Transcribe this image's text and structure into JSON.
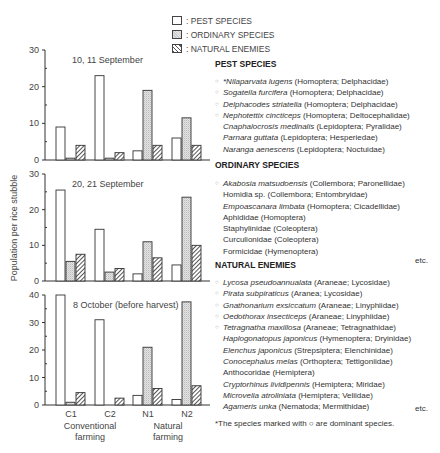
{
  "legend": {
    "items": [
      {
        "key": "pest",
        "label": ": PEST SPECIES"
      },
      {
        "key": "ordinary",
        "label": ": ORDINARY SPECIES"
      },
      {
        "key": "natural",
        "label": ": NATURAL ENEMIES"
      }
    ]
  },
  "chart_data": {
    "type": "bar",
    "ylabel": "Population per rice stubble",
    "categories": [
      "C1",
      "C2",
      "N1",
      "N2"
    ],
    "group_labels": [
      {
        "label_line1": "Conventional",
        "label_line2": "farming",
        "covers": [
          "C1",
          "C2"
        ]
      },
      {
        "label_line1": "Natural",
        "label_line2": "farming",
        "covers": [
          "N1",
          "N2"
        ]
      }
    ],
    "series_names": [
      "Pest species",
      "Ordinary species",
      "Natural enemies"
    ],
    "panels": [
      {
        "title": "10, 11 September",
        "ylim": [
          0,
          30
        ],
        "yticks": [
          0,
          10,
          20,
          30
        ],
        "series": [
          {
            "name": "Pest species",
            "values": [
              9,
              23,
              2.5,
              6
            ]
          },
          {
            "name": "Ordinary species",
            "values": [
              0.5,
              0.5,
              19,
              11.5
            ]
          },
          {
            "name": "Natural enemies",
            "values": [
              4,
              2,
              4,
              4
            ]
          }
        ]
      },
      {
        "title": "20, 21 September",
        "ylim": [
          0,
          30
        ],
        "yticks": [
          0,
          10,
          20,
          30
        ],
        "series": [
          {
            "name": "Pest species",
            "values": [
              25.5,
              14.5,
              2,
              4.5
            ]
          },
          {
            "name": "Ordinary species",
            "values": [
              5.5,
              2.5,
              11,
              23.5
            ]
          },
          {
            "name": "Natural enemies",
            "values": [
              7.5,
              3.5,
              6.5,
              10
            ]
          }
        ]
      },
      {
        "title": "8 October (before harvest)",
        "ylim": [
          0,
          40
        ],
        "yticks": [
          0,
          10,
          20,
          30,
          40
        ],
        "series": [
          {
            "name": "Pest species",
            "values": [
              40,
              31,
              3.5,
              2
            ]
          },
          {
            "name": "Ordinary species",
            "values": [
              1,
              0,
              21,
              37.5
            ]
          },
          {
            "name": "Natural enemies",
            "values": [
              4.5,
              2.5,
              6,
              7
            ]
          }
        ]
      }
    ]
  },
  "species": {
    "pest": {
      "title": "PEST SPECIES",
      "items": [
        {
          "dominant": true,
          "name": "*Nilaparvata lugens",
          "italic": true,
          "taxon": " (Homoptera; Delphacidae)"
        },
        {
          "dominant": true,
          "name": "Sogatella furcifera",
          "italic": true,
          "taxon": " (Homoptera; Delphacidae)"
        },
        {
          "dominant": true,
          "name": "Delphacodes striatella",
          "italic": true,
          "taxon": " (Homoptera; Delphacidae)"
        },
        {
          "dominant": true,
          "name": "Nephotettix cincticeps",
          "italic": true,
          "taxon": " (Homoptera; Deltocephalidae)"
        },
        {
          "dominant": false,
          "name": "Cnaphalocrosis medinalis",
          "italic": true,
          "taxon": " (Lepidoptera; Pyralidae)"
        },
        {
          "dominant": false,
          "name": "Parnara guttata",
          "italic": true,
          "taxon": " (Lepidoptera; Hesperiedae)"
        },
        {
          "dominant": false,
          "name": "Naranga aenescens",
          "italic": true,
          "taxon": " (Lepidoptera; Noctuidae)"
        }
      ]
    },
    "ordinary": {
      "title": "ORDINARY SPECIES",
      "items": [
        {
          "dominant": true,
          "name": "Akabosia matsudoensis",
          "italic": true,
          "taxon": " (Collembora; Paronellidae)"
        },
        {
          "dominant": false,
          "name": "Homidia sp.",
          "italic": false,
          "taxon": " (Collembora; Entombryidae)"
        },
        {
          "dominant": false,
          "name": "Empoascanara limbata",
          "italic": true,
          "taxon": " (Homoptera; Cicadellidae)"
        },
        {
          "dominant": false,
          "name": "Aphididae",
          "italic": false,
          "taxon": " (Homoptera)"
        },
        {
          "dominant": false,
          "name": "Staphylinidae",
          "italic": false,
          "taxon": " (Coleoptera)"
        },
        {
          "dominant": false,
          "name": "Curculionidae",
          "italic": false,
          "taxon": " (Coleoptera)"
        },
        {
          "dominant": false,
          "name": "Formicidae",
          "italic": false,
          "taxon": " (Hymenoptera)"
        }
      ],
      "etc": "etc."
    },
    "natural": {
      "title": "NATURAL ENEMIES",
      "items": [
        {
          "dominant": true,
          "name": "Lycosa pseudoannualata",
          "italic": true,
          "taxon": " (Araneae; Lycosidae)"
        },
        {
          "dominant": true,
          "name": "Pirata subpiraticus",
          "italic": true,
          "taxon": " (Aranea; Lycosidae)"
        },
        {
          "dominant": true,
          "name": "Gnathonarium exsiccatum",
          "italic": true,
          "taxon": " (Araneae; Linyphiidae)"
        },
        {
          "dominant": true,
          "name": "Oedothorax insecticeps",
          "italic": true,
          "taxon": " (Araneae; Linyphiidae)"
        },
        {
          "dominant": true,
          "name": "Tetragnatha maxillosa",
          "italic": true,
          "taxon": " (Araneae; Tetragnathidae)"
        },
        {
          "dominant": false,
          "name": "Haplogonatopus japonicus",
          "italic": true,
          "taxon": " (Hymenoptera; Dryinidae)"
        },
        {
          "dominant": false,
          "name": "Elenchus japonicus",
          "italic": true,
          "taxon": " (Strepsiptera; Elenchinidae)"
        },
        {
          "dominant": false,
          "name": "Conocephalus melas",
          "italic": true,
          "taxon": " (Orthoptera; Tettigoniidae)"
        },
        {
          "dominant": false,
          "name": "Anthocoridae",
          "italic": false,
          "taxon": " (Hemiptera)"
        },
        {
          "dominant": false,
          "name": "Cryptorhinus lividipennis",
          "italic": true,
          "taxon": " (Hemiptera; Miridae)"
        },
        {
          "dominant": false,
          "name": "Microvelia atroliniata",
          "italic": true,
          "taxon": " (Hemiptera; Veliidae)"
        },
        {
          "dominant": false,
          "name": "Agameris unka",
          "italic": true,
          "taxon": " (Nematoda; Mermithidae)"
        }
      ],
      "etc": "etc."
    },
    "footnote": "*The species marked with ○ are dominant species."
  }
}
